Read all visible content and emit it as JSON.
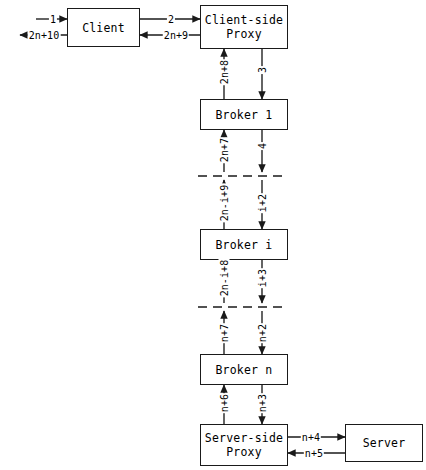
{
  "diagram": {
    "style": {
      "stroke": "#1a1a1a",
      "background": "#ffffff"
    },
    "nodes": [
      {
        "id": "client",
        "label_line1": "Client",
        "label_line2": "",
        "x": 67,
        "y": 8,
        "w": 73,
        "h": 39
      },
      {
        "id": "client-proxy",
        "label_line1": "Client-side",
        "label_line2": "Proxy",
        "x": 200,
        "y": 5,
        "w": 88,
        "h": 44
      },
      {
        "id": "broker-1",
        "label_line1": "Broker 1",
        "label_line2": "",
        "x": 200,
        "y": 99,
        "w": 88,
        "h": 31
      },
      {
        "id": "broker-i",
        "label_line1": "Broker i",
        "label_line2": "",
        "x": 200,
        "y": 229,
        "w": 88,
        "h": 31
      },
      {
        "id": "broker-n",
        "label_line1": "Broker n",
        "label_line2": "",
        "x": 200,
        "y": 354,
        "w": 88,
        "h": 31
      },
      {
        "id": "server-proxy",
        "label_line1": "Server-side",
        "label_line2": "Proxy",
        "x": 200,
        "y": 424,
        "w": 88,
        "h": 42
      },
      {
        "id": "server",
        "label_line1": "Server",
        "label_line2": "",
        "x": 345,
        "y": 424,
        "w": 78,
        "h": 38
      }
    ],
    "edge_labels": {
      "client_in": "1",
      "client_out": "2n+10",
      "client_to_proxy": "2",
      "proxy_to_client": "2n+9",
      "proxy_to_broker1": "3",
      "broker1_to_proxy": "2n+8",
      "broker1_down": "4",
      "broker1_up": "2n+7",
      "into_brokeri": "i+2",
      "outof_brokeri": "2n-i+9",
      "brokeri_down": "i+3",
      "brokeri_up": "2n-i+8",
      "into_brokern": "n+2",
      "outof_brokern": "n+7",
      "brokern_to_sproxy": "n+3",
      "sproxy_to_brokern": "n+6",
      "sproxy_to_server": "n+4",
      "server_to_sproxy": "n+5"
    }
  }
}
